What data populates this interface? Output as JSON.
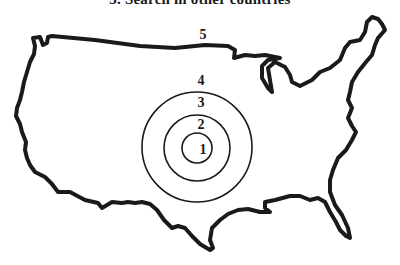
{
  "heading": "5. Search in other countries",
  "diagram": {
    "outline_color": "#1a1a1a",
    "background": "#ffffff",
    "labels": {
      "map": "5",
      "ring_outer": "4",
      "ring_middle": "3",
      "ring_inner": "2",
      "center": "1"
    }
  }
}
